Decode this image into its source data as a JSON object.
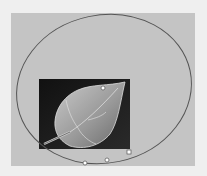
{
  "canvas": {
    "background": "#efefef",
    "panel_color": "#c4c4c4"
  },
  "image": {
    "subject": "leaf",
    "frame_color": "#1a1a1a"
  },
  "selection": {
    "shape": "ellipse",
    "stroke_color": "#555555",
    "handles": [
      {
        "name": "handle-top",
        "x": 103,
        "y": 88
      },
      {
        "name": "handle-bottom-1",
        "x": 85,
        "y": 163
      },
      {
        "name": "handle-bottom-2",
        "x": 107,
        "y": 160
      },
      {
        "name": "handle-corner",
        "x": 129,
        "y": 152
      }
    ]
  }
}
